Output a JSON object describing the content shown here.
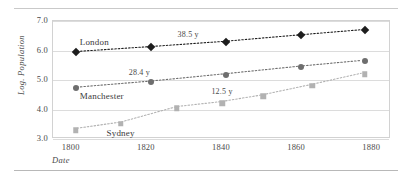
{
  "figure": {
    "has_top_rule": true,
    "has_bottom_rule": true
  },
  "chart_data": {
    "type": "line",
    "title": "",
    "subtitle": "",
    "xlabel": "Date",
    "ylabel": "Log. Population",
    "xlim": [
      1795,
      1885
    ],
    "ylim": [
      3.0,
      7.0
    ],
    "xticks": [
      "1800",
      "1820",
      "1840",
      "1860",
      "1880"
    ],
    "xtick_values": [
      1800,
      1820,
      1840,
      1860,
      1880
    ],
    "yticks": [
      "7.0",
      "6.0",
      "5.0",
      "4.0",
      "3.0"
    ],
    "ytick_values": [
      7.0,
      6.0,
      5.0,
      4.0,
      3.0
    ],
    "grid": "horizontal",
    "legend": "inline-labels",
    "series": [
      {
        "name": "London",
        "marker": "diamond",
        "color": "#1d1d1d",
        "linestyle": "dotted",
        "label_x": 1806,
        "label_y": 6.28,
        "annotation": "38.5 y",
        "annotation_x": 1831,
        "annotation_y": 6.55,
        "x": [
          1801,
          1821,
          1841,
          1861,
          1878
        ],
        "y": [
          5.95,
          6.12,
          6.3,
          6.52,
          6.7
        ]
      },
      {
        "name": "Manchester",
        "marker": "circle",
        "color": "#6e6e6e",
        "linestyle": "dotted",
        "label_x": 1808,
        "label_y": 4.47,
        "annotation": "28.4 y",
        "annotation_x": 1818,
        "annotation_y": 5.28,
        "x": [
          1801,
          1821,
          1841,
          1861,
          1878
        ],
        "y": [
          4.72,
          4.93,
          5.18,
          5.44,
          5.64
        ]
      },
      {
        "name": "Sydney",
        "marker": "square",
        "color": "#b2b2b2",
        "linestyle": "dotted",
        "label_x": 1813,
        "label_y": 3.22,
        "annotation": "12.5 y",
        "annotation_x": 1840,
        "annotation_y": 4.62,
        "x": [
          1801,
          1813,
          1828,
          1840,
          1851,
          1864,
          1878
        ],
        "y": [
          3.3,
          3.52,
          4.05,
          4.22,
          4.45,
          4.8,
          5.2
        ]
      }
    ]
  }
}
